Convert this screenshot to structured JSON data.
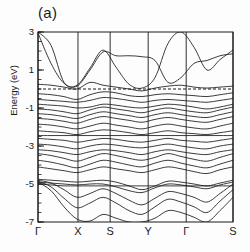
{
  "figure": {
    "panel_label": "(a)",
    "ylabel": "Energy (eV)"
  },
  "chart_data": {
    "type": "line",
    "title": "(a)",
    "xlabel": "",
    "ylabel": "Energy (eV)",
    "ylim": [
      -7,
      3
    ],
    "yticks": [
      3,
      1,
      -1,
      -3,
      -5,
      -7
    ],
    "ytick_labels": [
      "3",
      "1",
      "-1",
      "-3",
      "-5",
      "-7"
    ],
    "minor_ytick_step": 0.5,
    "grid": "vertical-highsym-lines",
    "legend": "none",
    "xtick_labels": [
      "Γ",
      "X",
      "S",
      "Y",
      "Γ",
      "S"
    ],
    "x_highsym_positions": [
      0.0,
      0.205,
      0.37,
      0.565,
      0.76,
      1.0
    ],
    "fermi_level": 0.0,
    "fermi_line_style": "dashed",
    "line_color": "#1a1a1a",
    "annotations": [
      "Conduction band maximum near S at about 2.0 eV",
      "Secondary conduction band peak near Y at about 1.8 eV",
      "Band touches top frame (3 eV) at second Gamma",
      "Dense manifold of valence bands between -0.5 and -6 eV"
    ],
    "series": [
      {
        "name": "cb-1",
        "y": [
          3.0,
          2.3,
          0.35,
          0.2,
          1.1,
          2.05,
          1.15,
          0.25,
          0.05,
          0.6,
          2.4,
          3.0,
          2.2,
          1.0,
          1.55,
          2.05
        ]
      },
      {
        "name": "cb-2",
        "y": [
          2.95,
          1.35,
          0.3,
          0.15,
          1.0,
          1.95,
          1.75,
          1.75,
          1.7,
          1.5,
          0.35,
          0.6,
          1.35,
          1.5,
          1.75,
          1.85
        ]
      },
      {
        "name": "cb-3",
        "y": [
          0.25,
          0.2,
          0.1,
          0.0,
          0.35,
          0.2,
          0.1,
          0.0,
          -0.1,
          0.05,
          0.15,
          0.2,
          0.1,
          0.05,
          0.1,
          0.15
        ]
      },
      {
        "name": "vb-01",
        "y": [
          -0.25,
          -0.3,
          -0.4,
          -0.55,
          -0.3,
          -0.15,
          -0.2,
          -0.35,
          -0.4,
          -0.3,
          -0.25,
          -0.3,
          -0.35,
          -0.4,
          -0.3,
          -0.2
        ]
      },
      {
        "name": "vb-02",
        "y": [
          -0.55,
          -0.6,
          -0.65,
          -0.7,
          -0.6,
          -0.45,
          -0.5,
          -0.6,
          -0.7,
          -0.6,
          -0.55,
          -0.6,
          -0.65,
          -0.7,
          -0.6,
          -0.5
        ]
      },
      {
        "name": "vb-03",
        "y": [
          -0.8,
          -0.85,
          -0.9,
          -1.0,
          -0.95,
          -0.8,
          -0.85,
          -0.95,
          -1.0,
          -0.9,
          -0.8,
          -0.85,
          -0.95,
          -1.05,
          -0.95,
          -0.8
        ]
      },
      {
        "name": "vb-04",
        "y": [
          -1.05,
          -1.1,
          -1.2,
          -1.3,
          -1.1,
          -0.95,
          -1.05,
          -1.15,
          -1.25,
          -1.1,
          -1.0,
          -1.1,
          -1.2,
          -1.25,
          -1.1,
          -0.95
        ]
      },
      {
        "name": "vb-05",
        "y": [
          -1.3,
          -1.35,
          -1.45,
          -1.55,
          -1.35,
          -1.2,
          -1.3,
          -1.4,
          -1.5,
          -1.35,
          -1.25,
          -1.35,
          -1.45,
          -1.5,
          -1.35,
          -1.2
        ]
      },
      {
        "name": "vb-06",
        "y": [
          -1.55,
          -1.6,
          -1.7,
          -1.8,
          -1.6,
          -1.45,
          -1.55,
          -1.65,
          -1.75,
          -1.6,
          -1.5,
          -1.6,
          -1.7,
          -1.75,
          -1.6,
          -1.45
        ]
      },
      {
        "name": "vb-07",
        "y": [
          -1.85,
          -1.9,
          -2.0,
          -2.1,
          -1.95,
          -1.8,
          -1.9,
          -2.0,
          -2.1,
          -1.95,
          -1.85,
          -1.95,
          -2.05,
          -2.1,
          -1.95,
          -1.8
        ]
      },
      {
        "name": "vb-08",
        "y": [
          -2.2,
          -2.25,
          -2.3,
          -2.4,
          -2.25,
          -2.15,
          -2.2,
          -2.3,
          -2.4,
          -2.3,
          -2.2,
          -2.3,
          -2.35,
          -2.4,
          -2.3,
          -2.2
        ]
      },
      {
        "name": "vb-09",
        "y": [
          -2.45,
          -2.45,
          -2.45,
          -2.45,
          -2.45,
          -2.45,
          -2.45,
          -2.45,
          -2.45,
          -2.45,
          -2.45,
          -2.45,
          -2.45,
          -2.45,
          -2.45,
          -2.45
        ]
      },
      {
        "name": "vb-10",
        "y": [
          -2.6,
          -2.65,
          -2.7,
          -2.8,
          -2.7,
          -2.6,
          -2.65,
          -2.75,
          -2.8,
          -2.7,
          -2.6,
          -2.7,
          -2.75,
          -2.8,
          -2.7,
          -2.6
        ]
      },
      {
        "name": "vb-11",
        "y": [
          -2.9,
          -2.95,
          -3.05,
          -3.15,
          -3.0,
          -2.9,
          -2.95,
          -3.05,
          -3.1,
          -3.0,
          -2.9,
          -3.0,
          -3.1,
          -3.15,
          -3.0,
          -2.9
        ]
      },
      {
        "name": "vb-12",
        "y": [
          -3.2,
          -3.25,
          -3.35,
          -3.45,
          -3.3,
          -3.2,
          -3.25,
          -3.35,
          -3.45,
          -3.3,
          -3.2,
          -3.3,
          -3.4,
          -3.45,
          -3.3,
          -3.2
        ]
      },
      {
        "name": "vb-13",
        "y": [
          -3.4,
          -3.5,
          -3.65,
          -3.8,
          -3.6,
          -3.4,
          -3.5,
          -3.65,
          -3.75,
          -3.6,
          -3.4,
          -3.55,
          -3.7,
          -3.8,
          -3.6,
          -3.4
        ]
      },
      {
        "name": "vb-14",
        "y": [
          -3.75,
          -3.85,
          -4.0,
          -4.15,
          -3.95,
          -3.75,
          -3.85,
          -4.0,
          -4.1,
          -3.9,
          -3.75,
          -3.9,
          -4.05,
          -4.15,
          -3.95,
          -3.75
        ]
      },
      {
        "name": "vb-15",
        "y": [
          -4.1,
          -4.2,
          -4.3,
          -4.4,
          -4.25,
          -4.1,
          -4.2,
          -4.3,
          -4.4,
          -4.25,
          -4.1,
          -4.2,
          -4.35,
          -4.45,
          -4.25,
          -4.1
        ]
      },
      {
        "name": "vb-16",
        "y": [
          -4.75,
          -4.8,
          -4.85,
          -4.9,
          -4.85,
          -4.8,
          -4.9,
          -5.1,
          -5.3,
          -5.1,
          -4.85,
          -4.9,
          -5.0,
          -5.1,
          -4.95,
          -4.8
        ]
      },
      {
        "name": "vb-17",
        "y": [
          -4.9,
          -4.95,
          -5.0,
          -5.05,
          -5.0,
          -5.0,
          -5.15,
          -5.35,
          -5.45,
          -5.2,
          -5.0,
          -5.05,
          -5.15,
          -5.25,
          -5.05,
          -4.9
        ]
      },
      {
        "name": "vb-18",
        "y": [
          -5.0,
          -5.05,
          -5.1,
          -5.1,
          -5.1,
          -5.1,
          -5.1,
          -5.1,
          -5.1,
          -5.1,
          -5.1,
          -5.1,
          -5.1,
          -5.1,
          -5.1,
          -5.1
        ]
      },
      {
        "name": "vb-19",
        "y": [
          -4.8,
          -4.95,
          -5.3,
          -5.7,
          -5.5,
          -5.25,
          -5.5,
          -5.85,
          -6.1,
          -5.75,
          -5.4,
          -5.5,
          -5.7,
          -5.95,
          -5.5,
          -5.0
        ]
      },
      {
        "name": "vb-20",
        "y": [
          -4.85,
          -5.15,
          -5.75,
          -6.25,
          -6.0,
          -5.7,
          -6.0,
          -6.4,
          -6.6,
          -6.2,
          -5.8,
          -5.95,
          -6.2,
          -6.5,
          -5.9,
          -5.3
        ]
      },
      {
        "name": "vb-21",
        "y": [
          -4.9,
          -5.35,
          -6.2,
          -6.85,
          -6.95,
          -6.6,
          -6.8,
          -7.0,
          -7.0,
          -6.8,
          -6.4,
          -6.5,
          -6.75,
          -7.0,
          -6.4,
          -5.7
        ]
      }
    ]
  }
}
